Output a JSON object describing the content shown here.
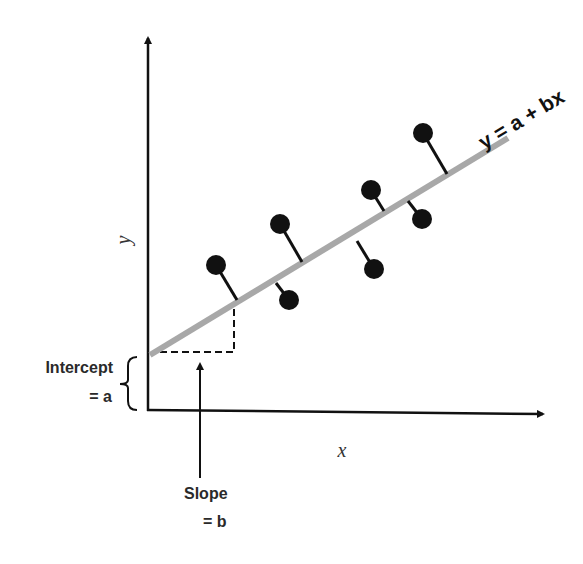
{
  "diagram": {
    "type": "linear-regression-illustration",
    "equation_label": "y = a + bx",
    "x_axis_label": "x",
    "y_axis_label": "y",
    "intercept_label": {
      "line1": "Intercept",
      "line2": "= a"
    },
    "slope_label": {
      "line1": "Slope",
      "line2": "= b"
    },
    "colors": {
      "axis": "#111111",
      "regression_line": "#a8a8a8",
      "points": "#111111",
      "residuals": "#111111",
      "dashed": "#111111"
    },
    "regression_line": {
      "x1": 150,
      "y1": 355,
      "x2": 508,
      "y2": 138
    },
    "points": [
      {
        "cx": 216,
        "cy": 265,
        "lx": 237,
        "ly": 300
      },
      {
        "cx": 289,
        "cy": 300,
        "lx": 276,
        "ly": 283
      },
      {
        "cx": 280,
        "cy": 224,
        "lx": 302,
        "ly": 262
      },
      {
        "cx": 374,
        "cy": 269,
        "lx": 357,
        "ly": 241
      },
      {
        "cx": 371,
        "cy": 190,
        "lx": 384,
        "ly": 211
      },
      {
        "cx": 422,
        "cy": 219,
        "lx": 408,
        "ly": 201
      },
      {
        "cx": 423,
        "cy": 133,
        "lx": 447,
        "ly": 174
      }
    ]
  }
}
